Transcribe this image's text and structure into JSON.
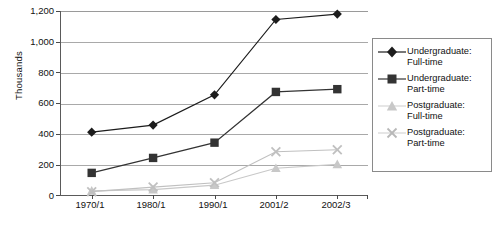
{
  "chart_data": {
    "type": "line",
    "title": "",
    "xlabel": "",
    "ylabel": "Thousands",
    "categories": [
      "1970/1",
      "1980/1",
      "1990/1",
      "2001/2",
      "2002/3"
    ],
    "ylim": [
      0,
      1200
    ],
    "yticks": [
      "0",
      "200",
      "400",
      "600",
      "800",
      "1,000",
      "1,200"
    ],
    "ytick_values": [
      0,
      200,
      400,
      600,
      800,
      1000,
      1200
    ],
    "grid": true,
    "legend_position": "right",
    "series": [
      {
        "name": "Undergraduate: Full-time",
        "marker": "diamond",
        "color": "#1c1c1c",
        "values": [
          414,
          460,
          656,
          1145,
          1180
        ]
      },
      {
        "name": "Undergraduate: Part-time",
        "marker": "square",
        "color": "#333333",
        "values": [
          150,
          247,
          346,
          675,
          693
        ]
      },
      {
        "name": "Postgraduate: Full-time",
        "marker": "triangle",
        "color": "#c8c8c8",
        "values": [
          33,
          41,
          70,
          180,
          205
        ]
      },
      {
        "name": "Postgraduate: Part-time",
        "marker": "cross",
        "color": "#c0c0c0",
        "values": [
          28,
          58,
          86,
          287,
          300
        ]
      }
    ]
  },
  "legend": {
    "entries": [
      {
        "line1": "Undergraduate:",
        "line2": "Full-time"
      },
      {
        "line1": "Undergraduate:",
        "line2": "Part-time"
      },
      {
        "line1": "Postgraduate:",
        "line2": "Full-time"
      },
      {
        "line1": "Postgraduate:",
        "line2": "Part-time"
      }
    ]
  },
  "colors": {
    "axis": "#5a5a5a",
    "grid": "#a9a9a9",
    "dark": "#1c1c1c",
    "light": "#c8c8c8"
  }
}
